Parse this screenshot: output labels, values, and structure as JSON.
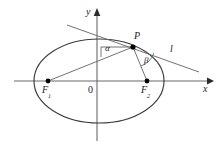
{
  "figure": {
    "axes": {
      "x_label": "x",
      "y_label": "y",
      "origin_label": "0"
    },
    "points": [
      {
        "id": "F1",
        "base": "F",
        "sub": "1",
        "x": 48,
        "y": 81
      },
      {
        "id": "F2",
        "base": "F",
        "sub": "2",
        "x": 147,
        "y": 81
      },
      {
        "id": "P",
        "base": "P",
        "sub": "",
        "x": 133,
        "y": 47
      }
    ],
    "angles": [
      {
        "id": "alpha",
        "label": "α",
        "x": 106,
        "y": 44
      },
      {
        "id": "beta",
        "label": "β",
        "x": 145,
        "y": 57
      }
    ],
    "line": {
      "label": "l",
      "x": 170,
      "y": 47
    },
    "colors": {
      "stroke": "#4a4a4a",
      "curve": "#3c3c3c",
      "point": "#000000",
      "text": "#1a1a1a",
      "background": "#ffffff"
    },
    "ellipse": {
      "cx": 99,
      "cy": 81,
      "rx": 65,
      "ry": 42
    }
  }
}
